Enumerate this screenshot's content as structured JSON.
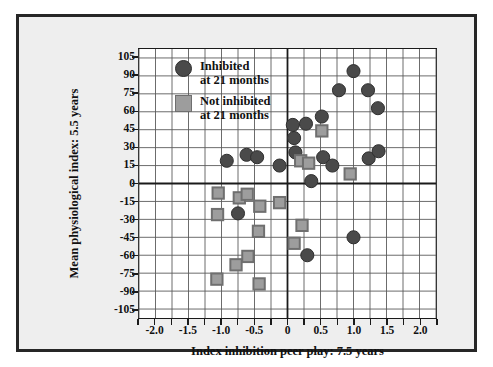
{
  "chart_data": {
    "type": "scatter",
    "title": "",
    "xlabel": "Index inhibition peer play: 7.5 years",
    "ylabel": "Mean physiological index: 5.5 years",
    "xlim": [
      -2.25,
      2.25
    ],
    "ylim": [
      -112.5,
      112.5
    ],
    "xticks": [
      "-2.0",
      "-1.5",
      "-1.0",
      "-0.5",
      "0",
      "0.5",
      "1.0",
      "1.5",
      "2.0"
    ],
    "xtick_values": [
      -2.0,
      -1.5,
      -1.0,
      -0.5,
      0,
      0.5,
      1.0,
      1.5,
      2.0
    ],
    "yticks": [
      "105",
      "90",
      "75",
      "60",
      "45",
      "30",
      "15",
      "0",
      "-15",
      "-30",
      "-45",
      "-60",
      "-75",
      "-90",
      "-105"
    ],
    "ytick_values": [
      105,
      90,
      75,
      60,
      45,
      30,
      15,
      0,
      -15,
      -30,
      -45,
      -60,
      -75,
      -90,
      -105
    ],
    "grid": true,
    "grid_minor_x_step": 0.25,
    "legend_position": "upper-left-inside",
    "series": [
      {
        "name": "Inhibited at 21 months",
        "marker": "circle",
        "color": "#4a4a4a",
        "edge_color": "#2e2e2e",
        "points": [
          [
            -0.92,
            19
          ],
          [
            -0.75,
            -25
          ],
          [
            -0.62,
            24
          ],
          [
            -0.46,
            22
          ],
          [
            -0.12,
            15
          ],
          [
            0.08,
            49
          ],
          [
            0.1,
            38
          ],
          [
            0.12,
            26
          ],
          [
            0.28,
            50
          ],
          [
            0.3,
            -60
          ],
          [
            0.36,
            2
          ],
          [
            0.52,
            56
          ],
          [
            0.54,
            22
          ],
          [
            0.68,
            15
          ],
          [
            0.78,
            78
          ],
          [
            1.0,
            94
          ],
          [
            1.0,
            -45
          ],
          [
            1.22,
            78
          ],
          [
            1.23,
            21
          ],
          [
            1.37,
            63
          ],
          [
            1.38,
            27
          ]
        ]
      },
      {
        "name": "Not inhibited at 21 months",
        "marker": "square",
        "color": "#9d9d9d",
        "edge_color": "#6f6f6f",
        "points": [
          [
            -1.05,
            -8
          ],
          [
            -1.06,
            -26
          ],
          [
            -1.07,
            -80
          ],
          [
            -0.78,
            -68
          ],
          [
            -0.73,
            -12
          ],
          [
            -0.61,
            -9
          ],
          [
            -0.6,
            -61
          ],
          [
            -0.44,
            -40
          ],
          [
            -0.43,
            -84
          ],
          [
            -0.42,
            -19
          ],
          [
            -0.12,
            -16
          ],
          [
            0.1,
            -50
          ],
          [
            0.2,
            19
          ],
          [
            0.22,
            -35
          ],
          [
            0.32,
            17
          ],
          [
            0.52,
            44
          ],
          [
            0.95,
            8
          ]
        ]
      }
    ]
  },
  "legend": {
    "items": [
      {
        "marker": "circle",
        "line1": "Inhibited",
        "line2": "at 21 months"
      },
      {
        "marker": "square",
        "line1": "Not inhibited",
        "line2": "at 21 months"
      }
    ]
  },
  "colors": {
    "inhibited": "#4a4a4a",
    "not_inhibited": "#9d9d9d",
    "grid": "#5a5a5a",
    "axis": "#1a1a1a",
    "frame": "#262626",
    "mat": "#eeeeee"
  }
}
